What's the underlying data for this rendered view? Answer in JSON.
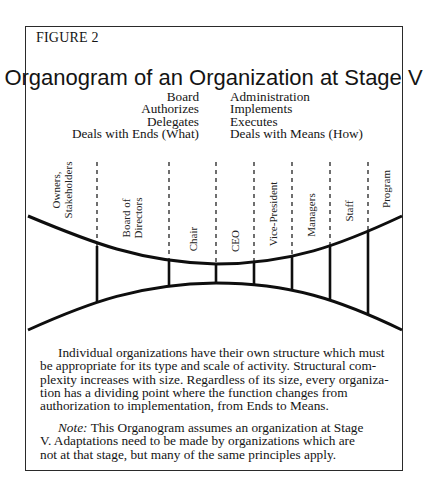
{
  "figure": {
    "label": "FIGURE 2",
    "title": "Organogram of an Organization at Stage V"
  },
  "columns": {
    "left": [
      "Board",
      "Authorizes",
      "Delegates",
      "Deals with Ends (What)"
    ],
    "right": [
      "Administration",
      "Implements",
      "Executes",
      "Deals with Means (How)"
    ]
  },
  "diagram": {
    "segments": [
      {
        "label_lines": [
          "Owners,",
          "Stakeholders"
        ]
      },
      {
        "label_lines": [
          "Board of",
          "Directors"
        ]
      },
      {
        "label_lines": [
          "Chair"
        ]
      },
      {
        "label_lines": [
          "CEO"
        ]
      },
      {
        "label_lines": [
          "Vice-President"
        ]
      },
      {
        "label_lines": [
          "Managers"
        ]
      },
      {
        "label_lines": [
          "Staff"
        ]
      },
      {
        "label_lines": [
          "Program"
        ]
      }
    ],
    "divider_x": [
      97,
      169,
      216,
      254,
      292,
      330,
      368
    ],
    "line_color": "#0e0e0e"
  },
  "paragraph1": {
    "lines": [
      "Individual organizations have their own structure which must",
      "be appropriate for its type and scale of activity.  Structural com-",
      "plexity increases with size.  Regardless of its size, every organiza-",
      "tion has a dividing point where the function changes from",
      "authorization to implementation, from Ends to Means."
    ]
  },
  "note": {
    "prefix": "Note:",
    "lines": [
      " This Organogram assumes an organization at Stage",
      "V.  Adaptations need to be made by organizations which are",
      "not at that stage, but many of the same principles apply."
    ]
  }
}
